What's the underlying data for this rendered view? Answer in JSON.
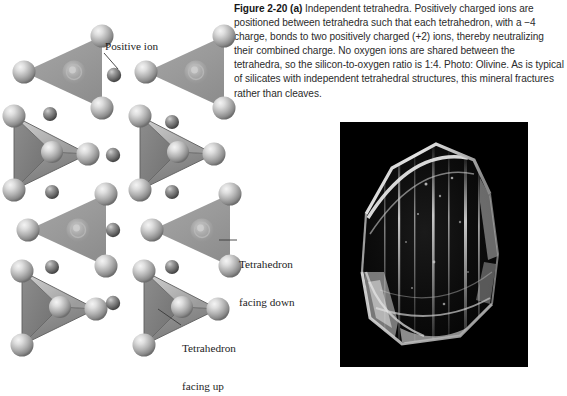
{
  "figure": {
    "label": "Figure 2-20",
    "part": "(a)",
    "caption_text": "Independent tetrahedra. Positively charged ions are positioned between tetrahedra such that each tetrahedron, with a −4 charge, bonds to two positively charged (+2) ions, thereby neutralizing their combined charge. No oxygen ions are shared between the tetrahedra, so the silicon-to-oxygen ratio is 1:4. Photo: Olivine. As is typical of silicates with independent tetrahedral structures, this mineral fractures rather than cleaves."
  },
  "diagram": {
    "callouts": {
      "positive_ion": "Positive ion",
      "tetrahedron_facing_down_line1": "Tetrahedron",
      "tetrahedron_facing_down_line2": "facing down",
      "tetrahedron_facing_up_line1": "Tetrahedron",
      "tetrahedron_facing_up_line2": "facing up"
    },
    "colors": {
      "oxygen_sphere_light": "#d8d8d8",
      "oxygen_sphere_mid": "#a9a9a9",
      "oxygen_sphere_dark": "#6f6f6f",
      "positive_ion_light": "#b4b4b4",
      "positive_ion_dark": "#4a4a4a",
      "triangle_face_flat": "#9b9b9b",
      "tetra_face_light": "#c2c2c2",
      "tetra_face_mid": "#8e8e8e",
      "tetra_face_dark": "#6b6b6b",
      "leader_line": "#3a3a3a"
    },
    "structure": {
      "rows": 4,
      "columns": 2,
      "row_types": [
        "facing-down",
        "facing-up",
        "facing-down",
        "facing-up"
      ],
      "tetrahedra_count": 8,
      "positive_ion_count": 11,
      "silicon_to_oxygen_ratio": "1:4",
      "tetrahedron_charge": "−4",
      "ion_charge": "+2"
    }
  },
  "photo": {
    "subject": "Olivine",
    "background_color": "#000000",
    "crystal_highlight_color": "#f2f2f2"
  }
}
